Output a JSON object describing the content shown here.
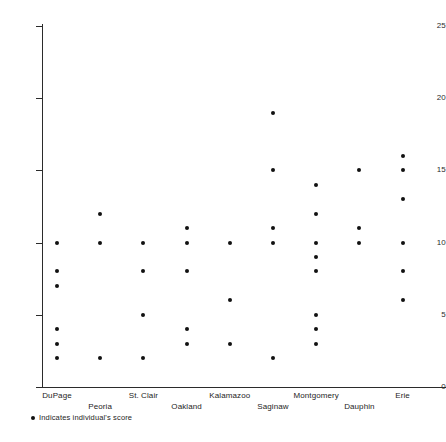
{
  "chart_data": {
    "type": "scatter",
    "title": "",
    "subtitle": "",
    "xlabel": "",
    "ylabel": "",
    "grid": false,
    "legend_position": "bottom-left",
    "ylim": [
      0,
      25
    ],
    "y_ticks": [
      0,
      5,
      10,
      15,
      20,
      25
    ],
    "y_tick_labels": [
      "0",
      "5",
      "10",
      "15",
      "20",
      "25"
    ],
    "categories": [
      "DuPage",
      "Peoria",
      "St. Clair",
      "Oakland",
      "Kalamazoo",
      "Saginaw",
      "Montgomery",
      "Dauphin",
      "Erie"
    ],
    "series": [
      {
        "name": "Indicates individual's score",
        "marker": "filled-circle",
        "color": "#111111",
        "points_by_category": [
          {
            "category": "DuPage",
            "values": [
              10,
              8,
              7,
              4,
              3,
              2
            ]
          },
          {
            "category": "Peoria",
            "values": [
              12,
              10,
              2
            ]
          },
          {
            "category": "St. Clair",
            "values": [
              10,
              8,
              5,
              2
            ]
          },
          {
            "category": "Oakland",
            "values": [
              11,
              10,
              8,
              4,
              3
            ]
          },
          {
            "category": "Kalamazoo",
            "values": [
              10,
              6,
              3
            ]
          },
          {
            "category": "Saginaw",
            "values": [
              19,
              15,
              11,
              10,
              2
            ]
          },
          {
            "category": "Montgomery",
            "values": [
              14,
              12,
              10,
              9,
              8,
              5,
              4,
              3
            ]
          },
          {
            "category": "Dauphin",
            "values": [
              15,
              11,
              10
            ]
          },
          {
            "category": "Erie",
            "values": [
              16,
              15,
              13,
              10,
              8,
              6
            ]
          }
        ]
      }
    ]
  },
  "legend": {
    "marker_name": "filled-circle-marker",
    "text": "Indicates individual's score"
  }
}
